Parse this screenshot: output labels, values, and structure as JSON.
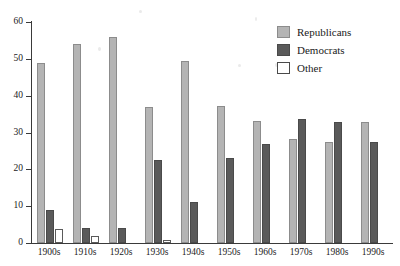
{
  "chart_data": {
    "type": "bar",
    "title": "",
    "subtitle": "",
    "xlabel": "",
    "ylabel": "",
    "ylim": [
      0,
      60
    ],
    "yticks": [
      0,
      10,
      20,
      30,
      40,
      50,
      60
    ],
    "grid": false,
    "legend_position": "top-right",
    "categories": [
      "1900s",
      "1910s",
      "1920s",
      "1930s",
      "1940s",
      "1950s",
      "1960s",
      "1970s",
      "1980s",
      "1990s"
    ],
    "series": [
      {
        "name": "Republicans",
        "color": "#b4b4b4",
        "values": [
          48.8,
          54.1,
          55.8,
          36.9,
          49.4,
          37.1,
          33.2,
          28.3,
          27.3,
          32.8
        ]
      },
      {
        "name": "Democrats",
        "color": "#5a5a5a",
        "values": [
          9.0,
          4.2,
          4.1,
          22.6,
          11.1,
          23.1,
          26.8,
          33.8,
          32.8,
          27.3
        ]
      },
      {
        "name": "Other",
        "color": "#ffffff",
        "values": [
          3.9,
          1.9,
          0,
          0.9,
          0,
          0,
          0,
          0,
          0,
          0
        ]
      }
    ]
  },
  "legend": {
    "items": [
      {
        "label": "Republicans",
        "swatch": "rep"
      },
      {
        "label": "Democrats",
        "swatch": "dem"
      },
      {
        "label": "Other",
        "swatch": "oth"
      }
    ]
  }
}
